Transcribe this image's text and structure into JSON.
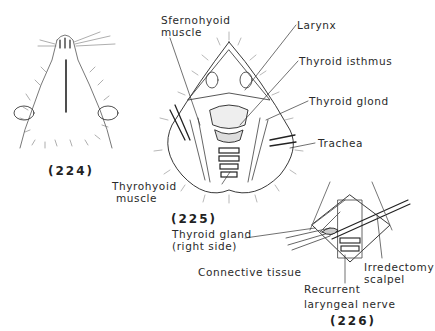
{
  "figures": [
    {
      "id": "224",
      "caption": "(224)"
    },
    {
      "id": "225",
      "caption": "(225)"
    },
    {
      "id": "226",
      "caption": "(226)"
    }
  ],
  "labels": {
    "sternohyoid_1": "Sfernohyoid",
    "sternohyoid_2": "muscle",
    "larynx": "Larynx",
    "thyroid_isthmus": "Thyroid isthmus",
    "thyroid_gland": "Thyroid glond",
    "trachea": "Trachea",
    "thyrohyoid_1": "Thyrohyoid",
    "thyrohyoid_2": "muscle",
    "thyroid_right_1": "Thyroid gland",
    "thyroid_right_2": "(right side)",
    "connective_tissue": "Connective tissue",
    "recurrent_1": "Recurrent",
    "recurrent_2": "laryngeal nerve",
    "irredectomy_1": "Irredectomy",
    "irredectomy_2": "scalpel"
  }
}
